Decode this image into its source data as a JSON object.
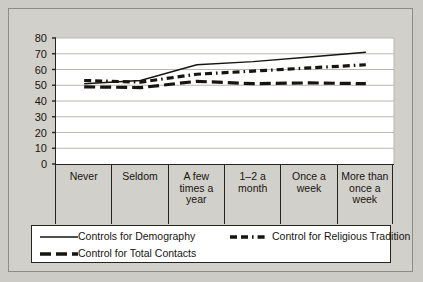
{
  "chart_data": {
    "type": "line",
    "title": "",
    "xlabel": "",
    "ylabel": "",
    "ylim": [
      0,
      80
    ],
    "yticks": [
      0,
      10,
      20,
      30,
      40,
      50,
      60,
      70,
      80
    ],
    "grid": true,
    "legend_position": "bottom",
    "categories": [
      "Never",
      "Seldom",
      "A few times a year",
      "1–2 a month",
      "Once a week",
      "More than once a week"
    ],
    "category_lines": [
      [
        "Never"
      ],
      [
        "Seldom"
      ],
      [
        "A few",
        "times a",
        "year"
      ],
      [
        "1–2 a",
        "month"
      ],
      [
        "Once a",
        "week"
      ],
      [
        "More than",
        "once a",
        "week"
      ]
    ],
    "series": [
      {
        "name": "Controls for Demography",
        "style": "solid",
        "color": "#17150f",
        "values": [
          51,
          53,
          63,
          65,
          68,
          71
        ]
      },
      {
        "name": "Control for Religious Tradition",
        "style": "dash-dot",
        "color": "#17150f",
        "values": [
          53,
          52,
          57,
          59,
          61,
          63
        ]
      },
      {
        "name": "Control for Total Contacts",
        "style": "long-dash",
        "color": "#17150f",
        "values": [
          49,
          48.5,
          52.5,
          51,
          51.5,
          51
        ]
      }
    ]
  },
  "colors": {
    "page_background": "#cdcbc6",
    "figure_background": "#d2d0cb",
    "plot_background": "#ffffff",
    "axis": "#26241e",
    "gridline": "#b9b7b2",
    "text": "#17150f"
  }
}
